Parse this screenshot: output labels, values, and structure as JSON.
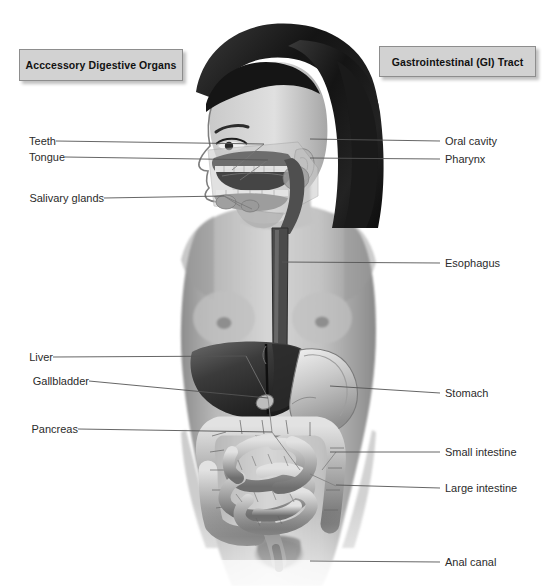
{
  "figure": {
    "width": 551,
    "height": 586,
    "background_color": "#ffffff"
  },
  "headers": {
    "accessory": {
      "label": "Acccessory Digestive Organs",
      "box_color": "#d2d2d2",
      "border_color": "#8d8d8d"
    },
    "gi": {
      "label": "Gastrointestinal (GI) Tract",
      "box_color": "#d2d2d2",
      "border_color": "#8d8d8d"
    }
  },
  "labels": {
    "left": [
      {
        "name": "teeth",
        "text": "Teeth",
        "x": 22,
        "y": 141,
        "line_x1": 56,
        "line_x2": 264,
        "line_y2": 144
      },
      {
        "name": "tongue",
        "text": "Tongue",
        "x": 22,
        "y": 157,
        "line_x1": 65,
        "line_x2": 268,
        "line_y2": 160
      },
      {
        "name": "salivary-glands",
        "text": "Salivary glands",
        "x": 22,
        "y": 198,
        "line_x1": 104,
        "line_x2": 224,
        "line_y2": 196
      },
      {
        "name": "liver",
        "text": "Liver",
        "x": 22,
        "y": 357,
        "line_x1": 53,
        "line_x2": 246,
        "line_y2": 356
      },
      {
        "name": "gallbladder",
        "text": "Gallbladder",
        "x": 22,
        "y": 381,
        "line_x1": 89,
        "line_x2": 268,
        "line_y2": 398
      },
      {
        "name": "pancreas",
        "text": "Pancreas",
        "x": 22,
        "y": 429,
        "line_x1": 78,
        "line_x2": 272,
        "line_y2": 432
      }
    ],
    "right": [
      {
        "name": "oral-cavity",
        "text": "Oral cavity",
        "x": 445,
        "y": 141,
        "line_x1": 310,
        "line_x2": 440,
        "line_y1": 139
      },
      {
        "name": "pharynx",
        "text": "Pharynx",
        "x": 445,
        "y": 159,
        "line_x1": 310,
        "line_x2": 440,
        "line_y1": 158
      },
      {
        "name": "esophagus",
        "text": "Esophagus",
        "x": 445,
        "y": 263,
        "line_x1": 282,
        "line_x2": 440,
        "line_y1": 262
      },
      {
        "name": "stomach",
        "text": "Stomach",
        "x": 445,
        "y": 393,
        "line_x1": 330,
        "line_x2": 440,
        "line_y1": 386
      },
      {
        "name": "small-intestine",
        "text": "Small intestine",
        "x": 445,
        "y": 452,
        "line_x1": 330,
        "line_x2": 440,
        "line_y1": 452
      },
      {
        "name": "large-intestine",
        "text": "Large intestine",
        "x": 445,
        "y": 488,
        "line_x1": 336,
        "line_x2": 440,
        "line_y1": 485
      },
      {
        "name": "anal-canal",
        "text": "Anal canal",
        "x": 445,
        "y": 562,
        "line_x1": 310,
        "line_x2": 440,
        "line_y1": 561
      }
    ]
  },
  "artwork": {
    "description": "grayscale photographic illustration of a woman in profile with overlaid digestive anatomy",
    "organs": [
      "liver",
      "gallbladder",
      "stomach",
      "pancreas",
      "small intestine",
      "large intestine",
      "esophagus",
      "oral cavity",
      "pharynx",
      "salivary glands",
      "teeth",
      "tongue",
      "anal canal"
    ]
  }
}
